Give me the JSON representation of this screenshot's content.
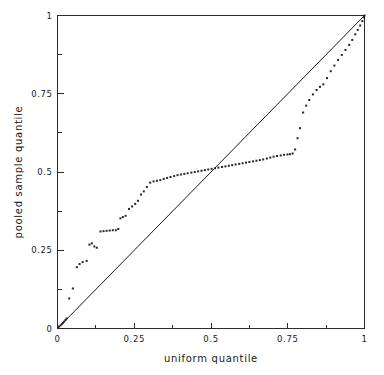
{
  "chart_data": {
    "type": "scatter",
    "title": "",
    "xlabel": "uniform quantile",
    "ylabel": "pooled sample quantile",
    "xlim": [
      0,
      1
    ],
    "ylim": [
      0,
      1
    ],
    "grid": false,
    "legend": null,
    "x_ticks": [
      {
        "value": 0,
        "label": "0",
        "major": true
      },
      {
        "value": 0.125,
        "label": "",
        "major": false
      },
      {
        "value": 0.25,
        "label": "0.25",
        "major": true
      },
      {
        "value": 0.375,
        "label": "",
        "major": false
      },
      {
        "value": 0.5,
        "label": "0.5",
        "major": true
      },
      {
        "value": 0.625,
        "label": "",
        "major": false
      },
      {
        "value": 0.75,
        "label": "0.75",
        "major": true
      },
      {
        "value": 0.875,
        "label": "",
        "major": false
      },
      {
        "value": 1,
        "label": "1",
        "major": true
      }
    ],
    "y_ticks": [
      {
        "value": 0,
        "label": "0",
        "major": true
      },
      {
        "value": 0.125,
        "label": "",
        "major": false
      },
      {
        "value": 0.25,
        "label": "0.25",
        "major": true
      },
      {
        "value": 0.375,
        "label": "",
        "major": false
      },
      {
        "value": 0.5,
        "label": "0.5",
        "major": true
      },
      {
        "value": 0.625,
        "label": "",
        "major": false
      },
      {
        "value": 0.75,
        "label": "0.75",
        "major": true
      },
      {
        "value": 0.875,
        "label": "",
        "major": false
      },
      {
        "value": 1,
        "label": "1",
        "major": true
      }
    ],
    "reference_line": {
      "name": "identity-line",
      "from": [
        0,
        0
      ],
      "to": [
        1,
        1
      ],
      "description": "y = x diagonal reference line"
    },
    "series": [
      {
        "name": "pooled sample quantiles",
        "marker": "square",
        "marker_size_px": 2,
        "color": "#262626",
        "points": [
          [
            0.005,
            0.006
          ],
          [
            0.01,
            0.01
          ],
          [
            0.014,
            0.014
          ],
          [
            0.018,
            0.018
          ],
          [
            0.022,
            0.022
          ],
          [
            0.026,
            0.027
          ],
          [
            0.03,
            0.032
          ],
          [
            0.038,
            0.096
          ],
          [
            0.05,
            0.128
          ],
          [
            0.063,
            0.196
          ],
          [
            0.072,
            0.206
          ],
          [
            0.082,
            0.212
          ],
          [
            0.095,
            0.216
          ],
          [
            0.104,
            0.268
          ],
          [
            0.112,
            0.272
          ],
          [
            0.12,
            0.262
          ],
          [
            0.128,
            0.258
          ],
          [
            0.14,
            0.31
          ],
          [
            0.15,
            0.311
          ],
          [
            0.16,
            0.312
          ],
          [
            0.17,
            0.313
          ],
          [
            0.18,
            0.314
          ],
          [
            0.19,
            0.314
          ],
          [
            0.198,
            0.318
          ],
          [
            0.205,
            0.352
          ],
          [
            0.213,
            0.356
          ],
          [
            0.222,
            0.36
          ],
          [
            0.233,
            0.382
          ],
          [
            0.243,
            0.39
          ],
          [
            0.253,
            0.398
          ],
          [
            0.262,
            0.408
          ],
          [
            0.272,
            0.428
          ],
          [
            0.281,
            0.438
          ],
          [
            0.291,
            0.452
          ],
          [
            0.302,
            0.466
          ],
          [
            0.313,
            0.47
          ],
          [
            0.324,
            0.472
          ],
          [
            0.335,
            0.474
          ],
          [
            0.346,
            0.478
          ],
          [
            0.357,
            0.481
          ],
          [
            0.368,
            0.484
          ],
          [
            0.38,
            0.487
          ],
          [
            0.391,
            0.49
          ],
          [
            0.402,
            0.492
          ],
          [
            0.413,
            0.494
          ],
          [
            0.424,
            0.496
          ],
          [
            0.436,
            0.498
          ],
          [
            0.447,
            0.5
          ],
          [
            0.458,
            0.502
          ],
          [
            0.469,
            0.504
          ],
          [
            0.48,
            0.506
          ],
          [
            0.491,
            0.508
          ],
          [
            0.502,
            0.51
          ],
          [
            0.513,
            0.512
          ],
          [
            0.524,
            0.514
          ],
          [
            0.536,
            0.516
          ],
          [
            0.547,
            0.518
          ],
          [
            0.558,
            0.52
          ],
          [
            0.569,
            0.522
          ],
          [
            0.58,
            0.524
          ],
          [
            0.592,
            0.526
          ],
          [
            0.603,
            0.528
          ],
          [
            0.614,
            0.53
          ],
          [
            0.625,
            0.532
          ],
          [
            0.637,
            0.534
          ],
          [
            0.648,
            0.536
          ],
          [
            0.659,
            0.538
          ],
          [
            0.67,
            0.54
          ],
          [
            0.682,
            0.543
          ],
          [
            0.693,
            0.546
          ],
          [
            0.704,
            0.549
          ],
          [
            0.715,
            0.551
          ],
          [
            0.727,
            0.553
          ],
          [
            0.738,
            0.555
          ],
          [
            0.749,
            0.556
          ],
          [
            0.757,
            0.557
          ],
          [
            0.766,
            0.559
          ],
          [
            0.774,
            0.572
          ],
          [
            0.782,
            0.608
          ],
          [
            0.79,
            0.64
          ],
          [
            0.8,
            0.69
          ],
          [
            0.81,
            0.712
          ],
          [
            0.82,
            0.73
          ],
          [
            0.832,
            0.748
          ],
          [
            0.844,
            0.762
          ],
          [
            0.855,
            0.772
          ],
          [
            0.866,
            0.78
          ],
          [
            0.878,
            0.8
          ],
          [
            0.89,
            0.822
          ],
          [
            0.902,
            0.84
          ],
          [
            0.914,
            0.858
          ],
          [
            0.926,
            0.874
          ],
          [
            0.938,
            0.89
          ],
          [
            0.95,
            0.906
          ],
          [
            0.96,
            0.922
          ],
          [
            0.97,
            0.94
          ],
          [
            0.978,
            0.954
          ],
          [
            0.986,
            0.968
          ],
          [
            0.993,
            0.982
          ],
          [
            0.998,
            0.994
          ],
          [
            1.0,
            1.0
          ]
        ]
      }
    ]
  },
  "figure": {
    "background_color": "#ffffff",
    "axis_color": "#2b2b2b",
    "marker_color": "#262626"
  }
}
